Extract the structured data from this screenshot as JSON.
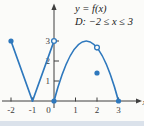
{
  "annotation": {
    "line1": "y = f(x)",
    "line2": "D:  −2 ≤ x ≤ 3"
  },
  "chart_data": {
    "type": "line",
    "title": "y = f(x)",
    "domain_label": "D: −2 ≤ x ≤ 3",
    "xlabel": "x",
    "ylabel": "y",
    "xlim": [
      -2,
      3
    ],
    "ylim": [
      0,
      3
    ],
    "grid": false,
    "x_ticks": {
      "values": [
        -2,
        -1,
        0,
        1,
        2,
        3
      ],
      "labels": [
        "-2",
        "-1",
        "0",
        "1",
        "2",
        "3"
      ]
    },
    "y_ticks": {
      "values": [
        1,
        2,
        3
      ],
      "labels": [
        "1",
        "2",
        "3"
      ]
    },
    "pieces": [
      {
        "kind": "line",
        "from": [
          -2,
          3
        ],
        "to": [
          -1,
          0
        ]
      },
      {
        "kind": "line",
        "from": [
          -1,
          0
        ],
        "to": [
          0,
          3
        ]
      },
      {
        "kind": "parabola",
        "from": [
          0,
          0
        ],
        "peak": [
          1.5,
          3
        ],
        "to": [
          3,
          0
        ]
      }
    ],
    "open_points": [
      [
        0,
        3
      ],
      [
        2,
        2.67
      ]
    ],
    "closed_points": [
      [
        -2,
        3
      ],
      [
        0,
        0
      ],
      [
        2,
        1.4
      ],
      [
        3,
        0
      ]
    ],
    "colors": {
      "curve": "#2e78bd",
      "axis": "#3f3f3f",
      "background": "#fbfbf9",
      "bottom_band": "#dbe2eb"
    }
  }
}
